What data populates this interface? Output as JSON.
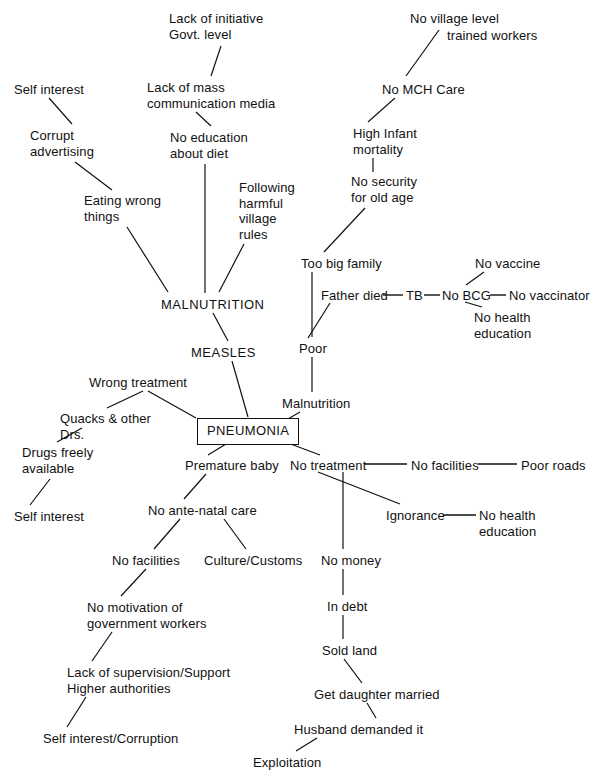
{
  "diagram": {
    "root_label": "PNEUMONIA",
    "line_color": "#111111",
    "text_color": "#111111",
    "background_color": "#ffffff",
    "nodes": [
      {
        "id": "lack-initiative",
        "text": "Lack of initiative\nGovt. level",
        "x": 169,
        "y": 11,
        "align": "left"
      },
      {
        "id": "no-village-level",
        "text": "No village level",
        "x": 410,
        "y": 11,
        "align": "left"
      },
      {
        "id": "trained-workers",
        "text": "trained workers",
        "x": 447,
        "y": 28,
        "align": "left"
      },
      {
        "id": "self-interest-top",
        "text": "Self interest",
        "x": 14,
        "y": 82,
        "align": "left"
      },
      {
        "id": "lack-mass-comm",
        "text": "Lack of mass\ncommunication media",
        "x": 147,
        "y": 80,
        "align": "left"
      },
      {
        "id": "no-mch-care",
        "text": "No MCH Care",
        "x": 382,
        "y": 82,
        "align": "left"
      },
      {
        "id": "corrupt-advertising",
        "text": "Corrupt\nadvertising",
        "x": 30,
        "y": 128,
        "align": "left"
      },
      {
        "id": "no-education-diet",
        "text": "No education\nabout diet",
        "x": 170,
        "y": 130,
        "align": "left"
      },
      {
        "id": "high-infant-mort",
        "text": "High Infant\nmortality",
        "x": 353,
        "y": 126,
        "align": "left"
      },
      {
        "id": "following-harmful",
        "text": "Following\nharmful\nvillage\nrules",
        "x": 239,
        "y": 180,
        "align": "left"
      },
      {
        "id": "no-security-old-age",
        "text": "No security\nfor old age",
        "x": 351,
        "y": 174,
        "align": "left"
      },
      {
        "id": "eating-wrong",
        "text": "Eating wrong\nthings",
        "x": 84,
        "y": 193,
        "align": "left"
      },
      {
        "id": "too-big-family",
        "text": "Too big family",
        "x": 301,
        "y": 256,
        "align": "left"
      },
      {
        "id": "no-vaccine",
        "text": "No vaccine",
        "x": 475,
        "y": 256,
        "align": "left"
      },
      {
        "id": "father-died",
        "text": "Father died",
        "x": 321,
        "y": 288,
        "align": "left"
      },
      {
        "id": "tb",
        "text": "TB",
        "x": 406,
        "y": 288,
        "align": "left"
      },
      {
        "id": "no-bcg",
        "text": "No BCG",
        "x": 442,
        "y": 288,
        "align": "left"
      },
      {
        "id": "no-vaccinator",
        "text": "No vaccinator",
        "x": 509,
        "y": 288,
        "align": "left"
      },
      {
        "id": "malnutrition-main",
        "text": "MALNUTRITION",
        "x": 161,
        "y": 297,
        "align": "left",
        "style": "caps"
      },
      {
        "id": "no-health-education-1",
        "text": "No health\neducation",
        "x": 474,
        "y": 310,
        "align": "left"
      },
      {
        "id": "poor",
        "text": "Poor",
        "x": 299,
        "y": 341,
        "align": "left"
      },
      {
        "id": "measles",
        "text": "MEASLES",
        "x": 191,
        "y": 345,
        "align": "left",
        "style": "caps"
      },
      {
        "id": "wrong-treatment",
        "text": "Wrong treatment",
        "x": 89,
        "y": 375,
        "align": "left"
      },
      {
        "id": "malnutrition-sub",
        "text": "Malnutrition",
        "x": 282,
        "y": 396,
        "align": "left"
      },
      {
        "id": "quacks-other-drs",
        "text": "Quacks & other\nDrs.",
        "x": 60,
        "y": 411,
        "align": "left"
      },
      {
        "id": "pneumonia",
        "text": "PNEUMONIA",
        "x": 197,
        "y": 418,
        "align": "left",
        "style": "boxed"
      },
      {
        "id": "drugs-freely",
        "text": "Drugs freely\navailable",
        "x": 22,
        "y": 445,
        "align": "left"
      },
      {
        "id": "premature-baby",
        "text": "Premature baby",
        "x": 185,
        "y": 458,
        "align": "left"
      },
      {
        "id": "no-treatment",
        "text": "No treatment",
        "x": 290,
        "y": 458,
        "align": "left"
      },
      {
        "id": "no-facilities-roads",
        "text": "No facilities",
        "x": 411,
        "y": 458,
        "align": "left"
      },
      {
        "id": "poor-roads",
        "text": "Poor roads",
        "x": 521,
        "y": 458,
        "align": "left"
      },
      {
        "id": "self-interest-drugs",
        "text": "Self interest",
        "x": 14,
        "y": 509,
        "align": "left"
      },
      {
        "id": "no-ante-natal",
        "text": "No ante-natal care",
        "x": 148,
        "y": 503,
        "align": "left"
      },
      {
        "id": "ignorance",
        "text": "Ignorance",
        "x": 386,
        "y": 508,
        "align": "left"
      },
      {
        "id": "no-health-education-2",
        "text": "No health\neducation",
        "x": 479,
        "y": 508,
        "align": "left"
      },
      {
        "id": "no-money",
        "text": "No money",
        "x": 321,
        "y": 553,
        "align": "left"
      },
      {
        "id": "no-facilities-ante",
        "text": "No facilities",
        "x": 112,
        "y": 553,
        "align": "left"
      },
      {
        "id": "culture-customs",
        "text": "Culture/Customs",
        "x": 204,
        "y": 553,
        "align": "left"
      },
      {
        "id": "no-motivation",
        "text": "No motivation of\ngovernment workers",
        "x": 87,
        "y": 600,
        "align": "left"
      },
      {
        "id": "in-debt",
        "text": "In debt",
        "x": 327,
        "y": 599,
        "align": "left"
      },
      {
        "id": "sold-land",
        "text": "Sold land",
        "x": 322,
        "y": 643,
        "align": "left"
      },
      {
        "id": "lack-supervision",
        "text": "Lack of supervision/Support\nHigher authorities",
        "x": 67,
        "y": 665,
        "align": "left"
      },
      {
        "id": "get-daughter-married",
        "text": "Get daughter married",
        "x": 314,
        "y": 687,
        "align": "left"
      },
      {
        "id": "husband-demanded",
        "text": "Husband demanded it",
        "x": 294,
        "y": 722,
        "align": "left"
      },
      {
        "id": "self-interest-corrupt",
        "text": "Self interest/Corruption",
        "x": 43,
        "y": 731,
        "align": "left"
      },
      {
        "id": "exploitation",
        "text": "Exploitation",
        "x": 253,
        "y": 755,
        "align": "left"
      }
    ],
    "edges": [
      {
        "from": "lack-initiative",
        "to": "lack-mass-comm",
        "x1": 221,
        "y1": 46,
        "x2": 211,
        "y2": 76
      },
      {
        "from": "self-interest-top",
        "to": "corrupt-advertising",
        "x1": 49,
        "y1": 98,
        "x2": 72,
        "y2": 124
      },
      {
        "from": "no-village-level",
        "to": "no-mch-care",
        "x1": 439,
        "y1": 30,
        "x2": 406,
        "y2": 76
      },
      {
        "from": "no-mch-care",
        "to": "high-infant-mort",
        "x1": 395,
        "y1": 98,
        "x2": 368,
        "y2": 122
      },
      {
        "from": "lack-mass-comm",
        "to": "no-education-diet",
        "x1": 196,
        "y1": 112,
        "x2": 211,
        "y2": 126
      },
      {
        "from": "corrupt-advertising",
        "to": "eating-wrong",
        "x1": 75,
        "y1": 162,
        "x2": 112,
        "y2": 190
      },
      {
        "from": "high-infant-mort",
        "to": "no-security-old-age",
        "x1": 373,
        "y1": 158,
        "x2": 373,
        "y2": 172
      },
      {
        "from": "no-education-diet",
        "to": "malnutrition-main",
        "x1": 205,
        "y1": 164,
        "x2": 205,
        "y2": 293
      },
      {
        "from": "no-security-old-age",
        "to": "too-big-family",
        "x1": 365,
        "y1": 208,
        "x2": 324,
        "y2": 252
      },
      {
        "from": "eating-wrong",
        "to": "malnutrition-main",
        "x1": 127,
        "y1": 227,
        "x2": 168,
        "y2": 292
      },
      {
        "from": "following-harmful",
        "to": "malnutrition-main",
        "x1": 244,
        "y1": 244,
        "x2": 219,
        "y2": 292
      },
      {
        "from": "too-big-family",
        "to": "poor",
        "x1": 312,
        "y1": 272,
        "x2": 312,
        "y2": 337
      },
      {
        "from": "no-vaccine",
        "to": "no-bcg",
        "x1": 484,
        "y1": 272,
        "x2": 466,
        "y2": 285
      },
      {
        "from": "father-died",
        "to": "tb",
        "x1": 383,
        "y1": 295,
        "x2": 403,
        "y2": 295,
        "kind": "dash"
      },
      {
        "from": "tb",
        "to": "no-bcg",
        "x1": 424,
        "y1": 295,
        "x2": 440,
        "y2": 295,
        "kind": "dash"
      },
      {
        "from": "no-bcg",
        "to": "no-vaccinator",
        "x1": 490,
        "y1": 295,
        "x2": 506,
        "y2": 295,
        "kind": "dash"
      },
      {
        "from": "no-bcg",
        "to": "no-health-education-1",
        "x1": 465,
        "y1": 302,
        "x2": 482,
        "y2": 307
      },
      {
        "from": "father-died",
        "to": "poor",
        "x1": 330,
        "y1": 303,
        "x2": 308,
        "y2": 338
      },
      {
        "from": "malnutrition-main",
        "to": "measles",
        "x1": 213,
        "y1": 313,
        "x2": 228,
        "y2": 341
      },
      {
        "from": "poor",
        "to": "malnutrition-sub",
        "x1": 312,
        "y1": 357,
        "x2": 312,
        "y2": 392
      },
      {
        "from": "measles",
        "to": "pneumonia",
        "x1": 232,
        "y1": 361,
        "x2": 248,
        "y2": 417
      },
      {
        "from": "wrong-treatment",
        "to": "pneumonia",
        "x1": 148,
        "y1": 391,
        "x2": 196,
        "y2": 418
      },
      {
        "from": "wrong-treatment",
        "to": "quacks-other-drs",
        "x1": 143,
        "y1": 391,
        "x2": 107,
        "y2": 408
      },
      {
        "from": "malnutrition-sub",
        "to": "pneumonia",
        "x1": 300,
        "y1": 412,
        "x2": 288,
        "y2": 419
      },
      {
        "from": "quacks-other-drs",
        "to": "drugs-freely",
        "x1": 82,
        "y1": 428,
        "x2": 57,
        "y2": 442
      },
      {
        "from": "pneumonia",
        "to": "premature-baby",
        "x1": 226,
        "y1": 444,
        "x2": 208,
        "y2": 455
      },
      {
        "from": "pneumonia",
        "to": "no-treatment",
        "x1": 288,
        "y1": 443,
        "x2": 320,
        "y2": 455
      },
      {
        "from": "no-treatment",
        "to": "no-facilities-roads",
        "x1": 364,
        "y1": 464,
        "x2": 407,
        "y2": 464,
        "kind": "dash"
      },
      {
        "from": "no-facilities-roads",
        "to": "poor-roads",
        "x1": 478,
        "y1": 464,
        "x2": 517,
        "y2": 464,
        "kind": "dash"
      },
      {
        "from": "drugs-freely",
        "to": "self-interest-drugs",
        "x1": 50,
        "y1": 479,
        "x2": 30,
        "y2": 505
      },
      {
        "from": "premature-baby",
        "to": "no-ante-natal",
        "x1": 206,
        "y1": 474,
        "x2": 184,
        "y2": 499
      },
      {
        "from": "no-treatment",
        "to": "ignorance",
        "x1": 318,
        "y1": 472,
        "x2": 400,
        "y2": 504
      },
      {
        "from": "ignorance",
        "to": "no-health-education-2",
        "x1": 443,
        "y1": 515,
        "x2": 476,
        "y2": 515,
        "kind": "dash"
      },
      {
        "from": "no-treatment",
        "to": "no-money",
        "x1": 343,
        "y1": 472,
        "x2": 343,
        "y2": 549
      },
      {
        "from": "no-ante-natal",
        "to": "no-facilities-ante",
        "x1": 180,
        "y1": 519,
        "x2": 154,
        "y2": 549
      },
      {
        "from": "no-ante-natal",
        "to": "culture-customs",
        "x1": 224,
        "y1": 519,
        "x2": 246,
        "y2": 549
      },
      {
        "from": "no-money",
        "to": "in-debt",
        "x1": 343,
        "y1": 569,
        "x2": 343,
        "y2": 595
      },
      {
        "from": "no-facilities-ante",
        "to": "no-motivation",
        "x1": 146,
        "y1": 569,
        "x2": 121,
        "y2": 596
      },
      {
        "from": "in-debt",
        "to": "sold-land",
        "x1": 343,
        "y1": 615,
        "x2": 343,
        "y2": 639
      },
      {
        "from": "sold-land",
        "to": "get-daughter-married",
        "x1": 344,
        "y1": 659,
        "x2": 362,
        "y2": 683
      },
      {
        "from": "no-motivation",
        "to": "lack-supervision",
        "x1": 112,
        "y1": 632,
        "x2": 92,
        "y2": 661
      },
      {
        "from": "get-daughter-married",
        "to": "husband-demanded",
        "x1": 367,
        "y1": 703,
        "x2": 376,
        "y2": 718
      },
      {
        "from": "lack-supervision",
        "to": "self-interest-corrupt",
        "x1": 86,
        "y1": 697,
        "x2": 67,
        "y2": 727
      },
      {
        "from": "husband-demanded",
        "to": "exploitation",
        "x1": 317,
        "y1": 738,
        "x2": 296,
        "y2": 751
      }
    ]
  },
  "footer": {
    "caption": ""
  }
}
